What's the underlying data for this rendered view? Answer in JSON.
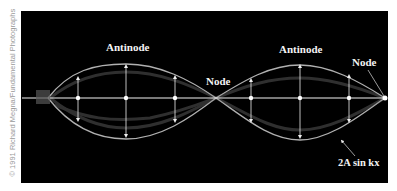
{
  "figure": {
    "labels": {
      "antinode_left": "Antinode",
      "antinode_right": "Antinode",
      "node_middle": "Node",
      "node_right": "Node",
      "envelope": "2A sin kx"
    },
    "credit": "© 1991 Richard Megna/Fundamental Photographs",
    "colors": {
      "background": "#000000",
      "string": "#ffffff",
      "page": "#ffffff"
    }
  }
}
